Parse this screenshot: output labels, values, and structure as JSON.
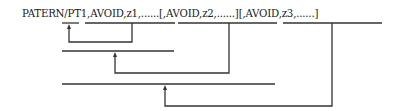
{
  "statement": {
    "full": "PATERN/PT1,AVOID,z1,......[,AVOID,z2,......][,AVOID,z3,......]",
    "parts": [
      "PATERN/",
      "PT1",
      ",",
      "AVOID,z1,......",
      "[",
      ",AVOID,z2,......",
      "]",
      "[",
      ",AVOID,z3,......",
      "]"
    ]
  },
  "colors": {
    "line": "#333333",
    "text": "#222222"
  }
}
